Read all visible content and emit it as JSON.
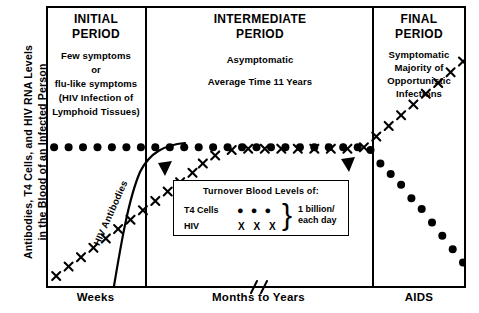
{
  "axis": {
    "y_label_line1": "Antibodies, T4 Cells, and HIV RNA Levels",
    "y_label_line2": "in the Blood of an Infected Person",
    "x_labels": [
      "Weeks",
      "Months to Years",
      "AIDS"
    ]
  },
  "panels": [
    {
      "id": "initial",
      "title_line1": "INITIAL",
      "title_line2": "PERIOD",
      "body": [
        "Few symptoms",
        "or",
        "flu-like symptoms",
        "(HIV Infection of",
        "Lymphoid Tissues)"
      ]
    },
    {
      "id": "intermediate",
      "title_line1": "INTERMEDIATE",
      "title_line2": "PERIOD",
      "body": [
        "Asymptomatic",
        "Average Time 11 Years"
      ]
    },
    {
      "id": "final",
      "title_line1": "FINAL",
      "title_line2": "PERIOD",
      "body": [
        "Symptomatic",
        "Majority of",
        "Opportunistic",
        "Infections"
      ]
    }
  ],
  "legend": {
    "heading": "Turnover  Blood Levels of:",
    "row_t4_label": "T4 Cells",
    "row_t4_marker": "● ● ●",
    "row_hiv_label": "HIV",
    "row_hiv_marker": "X X X",
    "brace": "}",
    "value_line1": "1 billion/",
    "value_line2": "each day"
  },
  "annotations": {
    "curve_label": "HIV Antibodies"
  },
  "chart_data": {
    "type": "line",
    "title": "",
    "xlabel": "",
    "ylabel": "Antibodies, T4 Cells, and HIV RNA Levels in the Blood of an Infected Person",
    "xlim": [
      0,
      100
    ],
    "ylim": [
      0,
      100
    ],
    "grid": false,
    "legend_position": "inside-center",
    "categories": [
      "Weeks",
      "Months to Years",
      "AIDS"
    ],
    "period_boundaries_pct": [
      23.6,
      77.6
    ],
    "series": [
      {
        "name": "T4 Cells",
        "marker": "filled-circle",
        "x": [
          1,
          4.5,
          8,
          11.5,
          15,
          18.5,
          22,
          25.5,
          29,
          32.5,
          36,
          39.5,
          43,
          46.5,
          50,
          53.5,
          57,
          60.5,
          64,
          67.5,
          71,
          74.5,
          77.6,
          80,
          82.5,
          85,
          87.5,
          90,
          92.5,
          95,
          97.5,
          100
        ],
        "y": [
          51,
          51,
          51,
          51,
          51,
          51,
          51,
          51,
          51,
          51,
          51,
          51,
          51,
          51,
          51,
          51,
          51,
          51,
          51,
          51,
          51,
          51,
          50,
          45,
          41,
          37,
          32,
          28,
          23,
          18,
          13,
          8
        ]
      },
      {
        "name": "HIV",
        "marker": "x-cross",
        "x": [
          1.5,
          4.5,
          7.5,
          10.5,
          13.5,
          16.5,
          19.5,
          22.5,
          25.5,
          28.5,
          31.5,
          34.5,
          37,
          40,
          44,
          48,
          52,
          56,
          60,
          64,
          68,
          72,
          76,
          79,
          82,
          85,
          88,
          91,
          94,
          97,
          100
        ],
        "y": [
          3,
          6.5,
          10,
          13.5,
          17,
          20.5,
          24,
          27.5,
          31,
          34.5,
          38,
          41.5,
          45,
          48,
          50,
          50.5,
          50.5,
          50.5,
          50.5,
          50.5,
          50.5,
          50.5,
          51,
          55,
          59,
          63,
          67,
          71,
          75,
          79,
          83
        ]
      },
      {
        "name": "HIV Antibodies",
        "marker": "smooth-curve",
        "x": [
          16,
          18,
          20,
          22,
          24,
          26,
          28,
          31,
          34,
          37,
          40
        ],
        "y": [
          0,
          8,
          17,
          27,
          36,
          43,
          47,
          50,
          51,
          51.5,
          52
        ]
      }
    ],
    "annotations": [
      {
        "type": "arrow",
        "direction": "up",
        "x_pct": 28.5,
        "label": ""
      },
      {
        "type": "arrow",
        "direction": "up",
        "x_pct": 72.0,
        "label": ""
      },
      {
        "type": "axis-break",
        "x_pct": 49.0
      }
    ]
  }
}
